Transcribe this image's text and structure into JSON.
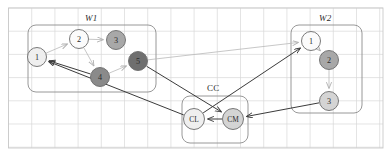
{
  "figure": {
    "type": "graph-diagram",
    "background": "#ffffff",
    "canvas": {
      "width": 390,
      "height": 155
    },
    "grid": {
      "visible": true,
      "color": "#d8d8d8",
      "spacing": 23.2,
      "origin_x": 8.5,
      "origin_y": 8.0,
      "border_color": "#c9c9c9"
    },
    "palette": {
      "node_white": "#fbfbfb",
      "node_light": "#efefef",
      "node_mid_light": "#d4d4d4",
      "node_mid": "#a8a8a8",
      "node_dark": "#8a8a8a",
      "node_darker": "#6f6f6f",
      "node_stroke": "#6b6b6b",
      "edge_dark": "#3b3b3b",
      "edge_light": "#b9b9b9",
      "group_stroke": "#8d8d8d",
      "text": "#2b2b2b"
    },
    "groups": [
      {
        "id": "W1",
        "label": "W1",
        "x": 28,
        "y": 25,
        "width": 128,
        "height": 67,
        "label_x": 85,
        "label_y": 13
      },
      {
        "id": "CC",
        "label": "CC",
        "x": 182,
        "y": 96,
        "width": 66,
        "height": 47,
        "label_x": 207,
        "label_y": 83
      },
      {
        "id": "W2",
        "label": "W2",
        "x": 291,
        "y": 25,
        "width": 71,
        "height": 88,
        "label_x": 319,
        "label_y": 13
      }
    ],
    "nodes": [
      {
        "id": "w1n1",
        "label": "1",
        "group": "W1",
        "cx": 37,
        "cy": 57,
        "r": 9.5,
        "fill": "#efefef"
      },
      {
        "id": "w1n2",
        "label": "2",
        "group": "W1",
        "cx": 79,
        "cy": 39,
        "r": 9.5,
        "fill": "#fbfbfb"
      },
      {
        "id": "w1n3",
        "label": "3",
        "group": "W1",
        "cx": 116,
        "cy": 40,
        "r": 9.5,
        "fill": "#a8a8a8"
      },
      {
        "id": "w1n4",
        "label": "4",
        "group": "W1",
        "cx": 100,
        "cy": 77,
        "r": 9.5,
        "fill": "#8a8a8a"
      },
      {
        "id": "w1n5",
        "label": "5",
        "group": "W1",
        "cx": 138,
        "cy": 61,
        "r": 9.5,
        "fill": "#6f6f6f"
      },
      {
        "id": "ccl",
        "label": "CL",
        "group": "CC",
        "cx": 194,
        "cy": 119,
        "r": 10.5,
        "fill": "#efefef"
      },
      {
        "id": "ccm",
        "label": "CM",
        "group": "CC",
        "cx": 233,
        "cy": 119,
        "r": 10.5,
        "fill": "#d4d4d4"
      },
      {
        "id": "w2n1",
        "label": "1",
        "group": "W2",
        "cx": 311,
        "cy": 41,
        "r": 9.5,
        "fill": "#fbfbfb"
      },
      {
        "id": "w2n2",
        "label": "2",
        "group": "W2",
        "cx": 329,
        "cy": 60,
        "r": 9.5,
        "fill": "#a8a8a8"
      },
      {
        "id": "w2n3",
        "label": "3",
        "group": "W2",
        "cx": 329,
        "cy": 101,
        "r": 9.5,
        "fill": "#d4d4d4"
      }
    ],
    "edges": [
      {
        "from": "w1n1",
        "to": "w1n2",
        "style": "light",
        "arrow": true
      },
      {
        "from": "w1n2",
        "to": "w1n3",
        "style": "light",
        "arrow": true
      },
      {
        "from": "w1n2",
        "to": "w1n4",
        "style": "light",
        "arrow": true
      },
      {
        "from": "w1n4",
        "to": "w1n5",
        "style": "light",
        "arrow": true
      },
      {
        "from": "w1n4",
        "to": "w1n1",
        "style": "dark",
        "arrow": true
      },
      {
        "from": "w1n5",
        "to": "w2n1",
        "style": "light",
        "arrow": true
      },
      {
        "from": "w1n5",
        "to": "ccm",
        "style": "dark",
        "arrow": true
      },
      {
        "from": "ccl",
        "to": "w2n1",
        "style": "dark",
        "arrow": true
      },
      {
        "from": "ccm",
        "to": "ccl",
        "style": "dark",
        "arrow": true
      },
      {
        "from": "w2n1",
        "to": "w2n2",
        "style": "light",
        "arrow": true
      },
      {
        "from": "w2n2",
        "to": "w2n3",
        "style": "light",
        "arrow": true
      },
      {
        "from": "w2n3",
        "to": "ccm",
        "style": "dark",
        "arrow": true
      },
      {
        "from": "ccl",
        "to": "w1n1",
        "style": "dark",
        "arrow": true
      }
    ]
  }
}
